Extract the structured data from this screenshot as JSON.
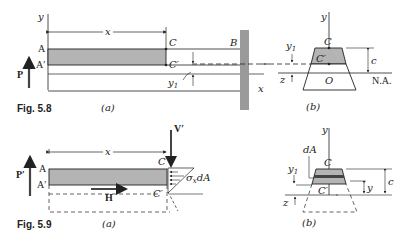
{
  "fig58": {
    "caption": "Fig. 5.8",
    "part_a": "(a)",
    "part_b": "(b)",
    "labels": {
      "y": "y",
      "x_dim": "x",
      "A": "A",
      "A_prime": "A′",
      "C": "C",
      "C_prime": "C′",
      "B": "B",
      "P": "P",
      "y1": "y",
      "y1_sub": "1",
      "x_axis": "x",
      "b_y": "y",
      "b_C": "C",
      "b_C_prime": "C′",
      "b_O": "O",
      "b_y1": "y",
      "b_y1_sub": "1",
      "b_c": "c",
      "b_z": "z",
      "b_NA": "N.A."
    }
  },
  "fig59": {
    "caption": "Fig. 5.9",
    "part_a": "(a)",
    "part_b": "(b)",
    "labels": {
      "x_dim": "x",
      "A": "A",
      "A_prime": "A′",
      "C": "C",
      "C_prime": "C′",
      "P_prime": "P′",
      "V_prime": "V′",
      "H": "H",
      "sigma": "σ",
      "sigma_sub": "x",
      "dA_text": "dA",
      "b_y": "y",
      "b_dA": "dA",
      "b_C": "C",
      "b_C_prime": "C′",
      "b_y1": "y",
      "b_y1_sub": "1",
      "b_c": "c",
      "b_z": "z",
      "b_yvar": "y"
    }
  },
  "colors": {
    "shade": "#b4b4b4",
    "wall": "#9a9a9a",
    "line": "#222222"
  }
}
